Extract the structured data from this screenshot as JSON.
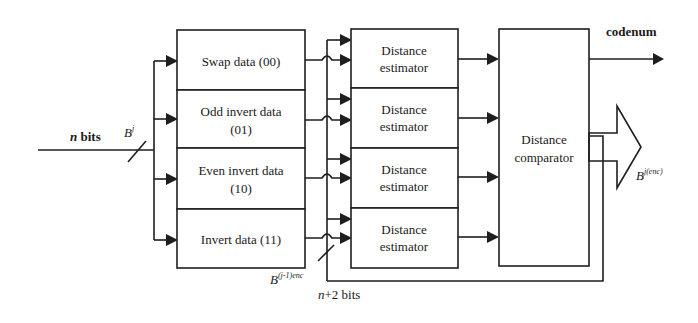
{
  "diagram": {
    "type": "block-diagram",
    "input": {
      "label_n": "n",
      "label_bits": " bits",
      "bus_label": "B",
      "bus_label_sup": "j"
    },
    "encoders": [
      {
        "line1": "Swap data (00)",
        "line2": ""
      },
      {
        "line1": "Odd invert   data",
        "line2": "(01)"
      },
      {
        "line1": "Even invert data",
        "line2": "(10)"
      },
      {
        "line1": "Invert data (11)",
        "line2": ""
      }
    ],
    "estimators": [
      {
        "line1": "Distance",
        "line2": "estimator"
      },
      {
        "line1": "Distance",
        "line2": "estimator"
      },
      {
        "line1": "Distance",
        "line2": "estimator"
      },
      {
        "line1": "Distance",
        "line2": "estimator"
      }
    ],
    "comparator": {
      "line1": "Distance",
      "line2": "comparator"
    },
    "outputs": {
      "codenum": "codenum",
      "encoded_label": "B",
      "encoded_sup": "j(enc)"
    },
    "feedback": {
      "label": "B",
      "label_sup": "(j-1)enc",
      "width_n": "n",
      "width_rest": "+2 bits"
    }
  }
}
